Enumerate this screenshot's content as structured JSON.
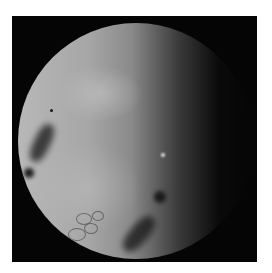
{
  "image": {
    "description": "Grayscale endoscopic view: circular illuminated field inside a black square frame on a white background",
    "colors": {
      "background": "#ffffff",
      "frame": "#050505",
      "field_light": "#b8b8b8",
      "field_dark": "#0a0a0a"
    },
    "features": [
      {
        "name": "dark-lesion-left",
        "kind": "dark fold"
      },
      {
        "name": "dark-lesion-lower-right",
        "kind": "dark fold"
      },
      {
        "name": "dark-spot-center-right",
        "kind": "dark spot"
      },
      {
        "name": "vessel-pattern-lower-left",
        "kind": "vascular pattern"
      },
      {
        "name": "bright-speck",
        "kind": "reflection"
      }
    ]
  }
}
